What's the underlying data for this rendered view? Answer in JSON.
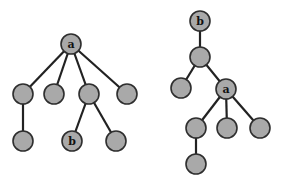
{
  "diagram": {
    "type": "tree-pair",
    "style": {
      "node_fill": "#a9a9a9",
      "node_stroke": "#2e2e2e",
      "edge_color": "#222222",
      "background": "#ffffff"
    },
    "trees": [
      {
        "name": "left-tree",
        "root": "a",
        "nodes": [
          {
            "id": "L0",
            "label": "a",
            "x": 71,
            "y": 44
          },
          {
            "id": "L1",
            "label": "",
            "x": 23,
            "y": 94
          },
          {
            "id": "L2",
            "label": "",
            "x": 54,
            "y": 94
          },
          {
            "id": "L3",
            "label": "",
            "x": 89,
            "y": 94
          },
          {
            "id": "L4",
            "label": "",
            "x": 127,
            "y": 94
          },
          {
            "id": "L5",
            "label": "",
            "x": 23,
            "y": 141
          },
          {
            "id": "L6",
            "label": "b",
            "x": 72,
            "y": 141
          },
          {
            "id": "L7",
            "label": "",
            "x": 116,
            "y": 141
          }
        ],
        "edges": [
          [
            "L0",
            "L1"
          ],
          [
            "L0",
            "L2"
          ],
          [
            "L0",
            "L3"
          ],
          [
            "L0",
            "L4"
          ],
          [
            "L1",
            "L5"
          ],
          [
            "L3",
            "L6"
          ],
          [
            "L3",
            "L7"
          ]
        ]
      },
      {
        "name": "right-tree",
        "root": "b",
        "nodes": [
          {
            "id": "R0",
            "label": "b",
            "x": 200,
            "y": 21
          },
          {
            "id": "R1",
            "label": "",
            "x": 200,
            "y": 57
          },
          {
            "id": "R2",
            "label": "",
            "x": 181,
            "y": 88
          },
          {
            "id": "R3",
            "label": "a",
            "x": 226,
            "y": 89
          },
          {
            "id": "R4",
            "label": "",
            "x": 196,
            "y": 128
          },
          {
            "id": "R5",
            "label": "",
            "x": 227,
            "y": 128
          },
          {
            "id": "R6",
            "label": "",
            "x": 260,
            "y": 128
          },
          {
            "id": "R7",
            "label": "",
            "x": 196,
            "y": 164
          }
        ],
        "edges": [
          [
            "R0",
            "R1"
          ],
          [
            "R1",
            "R2"
          ],
          [
            "R1",
            "R3"
          ],
          [
            "R3",
            "R4"
          ],
          [
            "R3",
            "R5"
          ],
          [
            "R3",
            "R6"
          ],
          [
            "R4",
            "R7"
          ]
        ]
      }
    ],
    "node_radius": 10
  }
}
